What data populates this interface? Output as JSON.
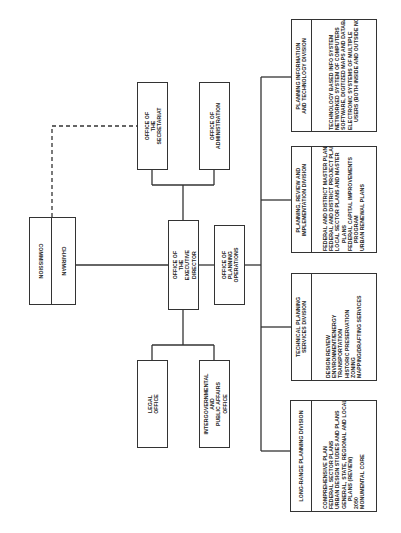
{
  "chart_title": "",
  "commission": {
    "commission_label": "COMMISSION",
    "chairman_label": "CHAIRMAN"
  },
  "offices": {
    "secretariat": "OFFICE OF THE\nSECRETARIAT",
    "administration": "OFFICE OF\nADMINISTRATION",
    "executive_director": "OFFICE OF THE\nEXECUTIVE DIRECTOR",
    "planning_operations": "OFFICE OF\nPLANNING OPERATIONS",
    "legal": "LEGAL OFFICE",
    "intergovernmental": "INTERGOVERNMENTAL AND\nPUBLIC AFFAIRS OFFICE"
  },
  "divisions": [
    {
      "title": "PLANNING INFORMATION\nAND TECHNOLOGY DIVISION",
      "items": [
        "TECHNOLOGY BASED INFO SYSTEM",
        "NETWORKED SYSTEM OF COMPUTERS",
        "SOFTWARE, DIGITIZED MAPS AND DATABASES",
        "ELECTRONIC SYSTEMS OF MULTIPLE",
        "USERS (BOTH INSIDE AND OUTSIDE NCPC)"
      ]
    },
    {
      "title": "PLANNING, REVIEW AND\nIMPLEMENTATION DIVISION",
      "items": [
        "FEDERAL AND DISTRICT MASTER PLANS",
        "FEDERAL AND DISTRICT PROJECT PLANS",
        "LOCAL SECTOR PLANS AND MASTER",
        "PLANS",
        "FEDERAL CAPITAL IMPROVEMENTS",
        "PROGRAM",
        "URBAN RENEWAL PLANS"
      ]
    },
    {
      "title": "TECHNICAL PLANNING\nSERVICES DIVISION",
      "items": [
        "DESIGN REVIEW",
        "ENVIRONMENT/ENERGY",
        "TRANSPORTATION",
        "HISTORIC PRESERVATION",
        "ZONING",
        "MAPPING/DRAFTING SERVICES"
      ]
    },
    {
      "title": "LONG-RANGE PLANNING DIVISION",
      "items": [
        "COMPREHENSIVE PLAN",
        "FEDERAL SECTOR PLANS",
        "URBAN DESIGN STUDIES AND PLANS",
        "GENERAL, STATE, REGIONAL AND LOCAL",
        "PLANS (REVIEW)",
        "2050",
        "MONUMENTAL CORE"
      ]
    }
  ],
  "colors": {
    "line": "#333333",
    "background": "#ffffff",
    "text": "#222222"
  }
}
